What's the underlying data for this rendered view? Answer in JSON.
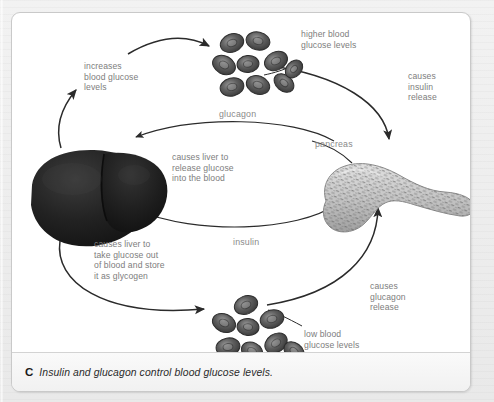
{
  "figure": {
    "caption_letter": "C",
    "caption_text": "Insulin and glucagon control blood glucose levels."
  },
  "diagram": {
    "type": "cycle-diagram",
    "title": "Insulin and glucagon control blood glucose levels",
    "nodes": [
      {
        "id": "high-glucose",
        "label": "higher blood\nglucose levels",
        "icon": "red-blood-cells-icon",
        "position": "top-center"
      },
      {
        "id": "low-glucose",
        "label": "low blood\nglucose levels",
        "icon": "red-blood-cells-icon",
        "position": "bottom-center"
      },
      {
        "id": "liver",
        "label": "liver",
        "icon": "liver-organ-icon",
        "position": "left-center"
      },
      {
        "id": "pancreas",
        "label": "pancreas",
        "icon": "pancreas-organ-icon",
        "position": "right-center"
      }
    ],
    "edge_labels": {
      "increases_blood_glucose": "increases\nblood glucose\nlevels",
      "causes_insulin_release": "causes\ninsulin\nrelease",
      "glucagon": "glucagon",
      "causes_liver_release": "causes liver to\nrelease glucose\ninto the blood",
      "pancreas": "pancreas",
      "causes_liver_take_up": "causes liver to\ntake glucose out\nof blood and store\nit as glycogen",
      "insulin": "insulin",
      "causes_glucagon_release": "causes\nglucagon\nrelease",
      "low_blood_glucose": "low blood\nglucose levels",
      "higher_blood_glucose": "higher blood\nglucose levels"
    },
    "colors": {
      "panel_background": "#ffffff",
      "page_background": "#efefef",
      "arrow": "#2b2b2b",
      "note_text": "#7d7d7d",
      "caption_text": "#2b2b2b",
      "liver": "#232323",
      "pancreas": "#b9b9b9",
      "red_blood_cell": "#555555"
    }
  }
}
